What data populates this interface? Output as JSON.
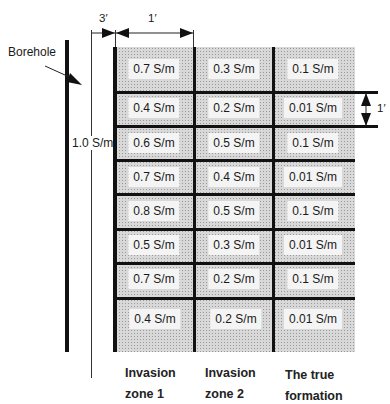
{
  "dimension_labels": {
    "borehole_gap": "3′",
    "column_width": "1′",
    "row_height": "1′"
  },
  "borehole_label": "Borehole",
  "borehole_conductivity": "1.0 S/m",
  "columns": [
    {
      "title_line1": "Invasion",
      "title_line2": "zone 1"
    },
    {
      "title_line1": "Invasion",
      "title_line2": "zone 2"
    },
    {
      "title_line1": "The true",
      "title_line2": "formation"
    }
  ],
  "rows": [
    [
      "0.7 S/m",
      "0.3 S/m",
      "0.1 S/m"
    ],
    [
      "0.4 S/m",
      "0.2 S/m",
      "0.01 S/m"
    ],
    [
      "0.6 S/m",
      "0.5 S/m",
      "0.1 S/m"
    ],
    [
      "0.7 S/m",
      "0.4 S/m",
      "0.01 S/m"
    ],
    [
      "0.8 S/m",
      "0.5 S/m",
      "0.1 S/m"
    ],
    [
      "0.5 S/m",
      "0.3 S/m",
      "0.01 S/m"
    ],
    [
      "0.7 S/m",
      "0.2 S/m",
      "0.1 S/m"
    ],
    [
      "0.4 S/m",
      "0.2 S/m",
      "0.01 S/m"
    ]
  ],
  "colors": {
    "line": "#111111",
    "fill": "#d8d8d8",
    "label_bg": "#f4f4f4"
  }
}
